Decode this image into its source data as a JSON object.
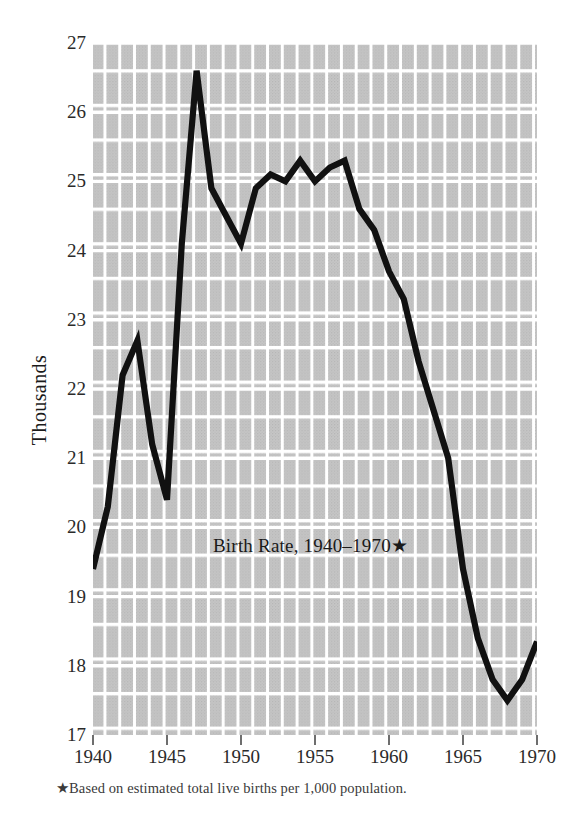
{
  "chart_data": {
    "type": "line",
    "title": "Birth Rate, 1940–1970★",
    "subtitle": "",
    "xlabel": "",
    "ylabel": "Thousands",
    "footnote": "★Based on estimated total live births per 1,000 population.",
    "xlim": [
      1940,
      1970
    ],
    "ylim": [
      17,
      27
    ],
    "grid": true,
    "legend": false,
    "legend_position": "none",
    "x_tick_labels": [
      "1940",
      "1945",
      "1950",
      "1955",
      "1960",
      "1965",
      "1970"
    ],
    "x_ticks": [
      1940,
      1945,
      1950,
      1955,
      1960,
      1965,
      1970
    ],
    "y_tick_labels": [
      "27",
      "26",
      "25",
      "24",
      "23",
      "22",
      "21",
      "20",
      "19",
      "18",
      "17"
    ],
    "y_ticks": [
      27,
      26,
      25,
      24,
      23,
      22,
      21,
      20,
      19,
      18,
      17
    ],
    "line_color": "#111111",
    "plot_background": "#c9c9c9",
    "gridline_color": "#ffffff",
    "x": [
      1940,
      1941,
      1942,
      1943,
      1944,
      1945,
      1946,
      1947,
      1948,
      1949,
      1950,
      1951,
      1952,
      1953,
      1954,
      1955,
      1956,
      1957,
      1958,
      1959,
      1960,
      1961,
      1962,
      1963,
      1964,
      1965,
      1966,
      1967,
      1968,
      1969,
      1970
    ],
    "values": [
      19.4,
      20.3,
      22.2,
      22.7,
      21.2,
      20.4,
      24.1,
      26.6,
      24.9,
      24.5,
      24.1,
      24.9,
      25.1,
      25.0,
      25.3,
      25.0,
      25.2,
      25.3,
      24.6,
      24.3,
      23.7,
      23.3,
      22.4,
      21.7,
      21.0,
      19.4,
      18.4,
      17.8,
      17.5,
      17.8,
      18.35
    ],
    "series": [
      {
        "name": "Birth Rate",
        "values": [
          19.4,
          20.3,
          22.2,
          22.7,
          21.2,
          20.4,
          24.1,
          26.6,
          24.9,
          24.5,
          24.1,
          24.9,
          25.1,
          25.0,
          25.3,
          25.0,
          25.2,
          25.3,
          24.6,
          24.3,
          23.7,
          23.3,
          22.4,
          21.7,
          21.0,
          19.4,
          18.4,
          17.8,
          17.5,
          17.8,
          18.35
        ]
      }
    ]
  }
}
